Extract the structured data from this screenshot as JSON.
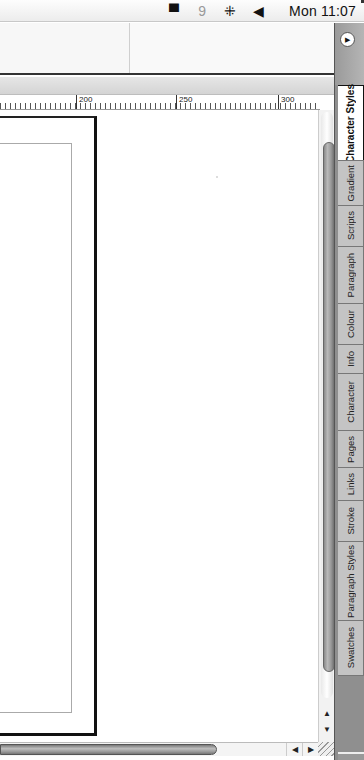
{
  "menubar": {
    "icons": [
      "chat-icon",
      "nine-icon",
      "input-flag-icon",
      "volume-icon"
    ],
    "icon_glyphs": [
      "▀",
      "9",
      "⁜",
      "◀"
    ],
    "clock": "Mon 11:07"
  },
  "ruler": {
    "marks": [
      {
        "label": "200",
        "x": 76
      },
      {
        "label": "250",
        "x": 176
      },
      {
        "label": "300",
        "x": 278
      }
    ]
  },
  "side_panel": {
    "menu_glyph": "▶",
    "tabs": [
      {
        "label": "Character Styles",
        "height": 76,
        "active": true
      },
      {
        "label": "Gradient",
        "height": 46,
        "active": false
      },
      {
        "label": "Scripts",
        "height": 42,
        "active": false
      },
      {
        "label": "Paragraph",
        "height": 58,
        "active": false
      },
      {
        "label": "Colour",
        "height": 42,
        "active": false
      },
      {
        "label": "Info",
        "height": 30,
        "active": false
      },
      {
        "label": "Character",
        "height": 58,
        "active": false
      },
      {
        "label": "Pages",
        "height": 38,
        "active": false
      },
      {
        "label": "Links",
        "height": 34,
        "active": false
      },
      {
        "label": "Stroke",
        "height": 42,
        "active": false
      },
      {
        "label": "Paragraph Styles",
        "height": 80,
        "active": false
      },
      {
        "label": "Swatches",
        "height": 56,
        "active": false
      }
    ]
  },
  "scrollbars": {
    "up_glyph": "▲",
    "down_glyph": "▼",
    "left_glyph": "◀",
    "right_glyph": "▶"
  }
}
